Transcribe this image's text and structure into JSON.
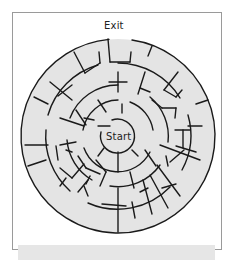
{
  "maze": {
    "exit_label": "Exit",
    "start_label": "Start",
    "center": [
      118,
      136
    ],
    "ring_radii": [
      97,
      73,
      51,
      36,
      17
    ],
    "colors": {
      "fill": "#e4e4e4",
      "wall": "#1a1a1a",
      "frame": "#9a9a9a",
      "band": "#e6e6e6",
      "page": "#ffffff"
    }
  }
}
